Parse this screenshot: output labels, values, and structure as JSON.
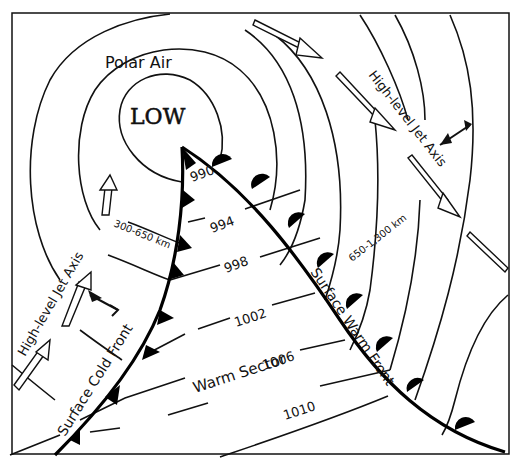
{
  "diagram": {
    "title_labels": {
      "low": "LOW",
      "polar_air": "Polar Air",
      "warm_sector": "Warm Sector",
      "cold_front": "Surface Cold Front",
      "warm_front": "Surface Warm Front",
      "jet_axis_left": "High-level Jet Axis",
      "jet_axis_right": "High-level Jet Axis",
      "dist_left": "300-650 km",
      "dist_right": "650-1,300 km"
    },
    "isobars": [
      "990",
      "994",
      "998",
      "1002",
      "1006",
      "1010"
    ],
    "colors": {
      "line": "#111111",
      "background": "#ffffff"
    }
  }
}
